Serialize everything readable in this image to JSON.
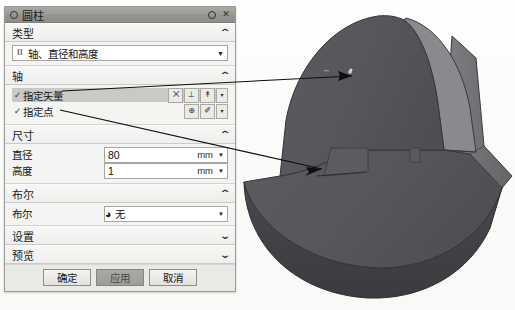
{
  "window": {
    "title": "圆柱",
    "title_icon": "circle-icon",
    "reset_icon": "reset-circle-icon",
    "close_icon": "close-icon"
  },
  "sections": {
    "type": {
      "header": "类型",
      "chevron": "⌃",
      "combo_value": "轴、直径和高度",
      "combo_icon": "axis-diameter-height-icon",
      "combo_arrow": "▼"
    },
    "axis": {
      "header": "轴",
      "chevron": "⌃",
      "rows": [
        {
          "check": "✓",
          "label": "指定矢量",
          "selected": true,
          "buttons": [
            {
              "name": "vector-xyz-button",
              "glyph": "⨉"
            },
            {
              "name": "vector-inference-button",
              "glyph": "⊥"
            },
            {
              "name": "vector-constructor-button",
              "glyph": "↟"
            },
            {
              "name": "vector-dropdown-button",
              "glyph": "▾"
            }
          ]
        },
        {
          "check": "✓",
          "label": "指定点",
          "selected": false,
          "buttons": [
            {
              "name": "point-snap-button",
              "glyph": "⊕"
            },
            {
              "name": "point-constructor-button",
              "glyph": "✐"
            },
            {
              "name": "point-dropdown-button",
              "glyph": "▾"
            }
          ]
        }
      ]
    },
    "dimensions": {
      "header": "尺寸",
      "chevron": "⌃",
      "fields": [
        {
          "label": "直径",
          "value": "80",
          "unit": "mm",
          "arrow": "▼"
        },
        {
          "label": "高度",
          "value": "1",
          "unit": "mm",
          "arrow": "▼"
        }
      ]
    },
    "boolean": {
      "header": "布尔",
      "chevron": "⌃",
      "row_label": "布尔",
      "value": "无",
      "value_icon": "boolean-none-icon",
      "arrow": "▼"
    },
    "settings": {
      "header": "设置",
      "chevron": "⌄"
    },
    "preview": {
      "header": "预览",
      "chevron": "⌄"
    }
  },
  "footer": {
    "ok": "确定",
    "apply": "应用",
    "cancel": "取消"
  },
  "viewport": {
    "model_name": "cylinder-solid-model",
    "annotations": [
      {
        "name": "annotation-arrow-to-top-face"
      },
      {
        "name": "annotation-arrow-to-point-marker"
      }
    ]
  },
  "colors": {
    "model_front": "#56565a",
    "model_side": "#6e6e72",
    "model_side_light": "#8b8b8e",
    "model_bottom": "#3f3f43",
    "dialog_bg": "#f4f4f2",
    "titlebar": "#9b9b97",
    "selected_row": "#c9c9c5",
    "page_bg": "#fdfdfc"
  }
}
